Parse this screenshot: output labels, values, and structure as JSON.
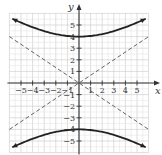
{
  "chart_data": {
    "type": "line",
    "title": "",
    "xlabel": "x",
    "ylabel": "y",
    "xlim": [
      -6,
      6
    ],
    "ylim": [
      -6,
      6
    ],
    "grid": true,
    "x_ticks": [
      -5,
      -4,
      -3,
      -2,
      -1,
      1,
      2,
      3,
      4,
      5
    ],
    "y_ticks": [
      -5,
      -4,
      -3,
      -2,
      -1,
      1,
      2,
      3,
      4,
      5
    ],
    "x_tick_labels": [
      "−5",
      "−4",
      "−3",
      "−2",
      "−1",
      "1",
      "2",
      "3",
      "4",
      "5"
    ],
    "y_tick_labels": [
      "−5",
      "−4",
      "−3",
      "−2",
      "−1",
      "1",
      "2",
      "3",
      "4",
      "5"
    ],
    "series": [
      {
        "name": "hyperbola upper branch",
        "equation": "y^2/16 - x^2/36 = 1",
        "style": "solid",
        "color": "#222222",
        "x": [
          -6,
          -4,
          -2,
          0,
          2,
          4,
          6
        ],
        "values": [
          5.66,
          4.81,
          4.22,
          4.0,
          4.22,
          4.81,
          5.66
        ]
      },
      {
        "name": "hyperbola lower branch",
        "style": "solid",
        "color": "#222222",
        "x": [
          -6,
          -4,
          -2,
          0,
          2,
          4,
          6
        ],
        "values": [
          -5.66,
          -4.81,
          -4.22,
          -4.0,
          -4.22,
          -4.81,
          -5.66
        ]
      },
      {
        "name": "asymptote y = 2/3 x",
        "style": "dashed",
        "color": "#555555",
        "x": [
          -6,
          6
        ],
        "values": [
          -4,
          4
        ]
      },
      {
        "name": "asymptote y = -2/3 x",
        "style": "dashed",
        "color": "#555555",
        "x": [
          -6,
          6
        ],
        "values": [
          4,
          -4
        ]
      }
    ],
    "vertices": [
      [
        0,
        4
      ],
      [
        0,
        -4
      ]
    ]
  }
}
